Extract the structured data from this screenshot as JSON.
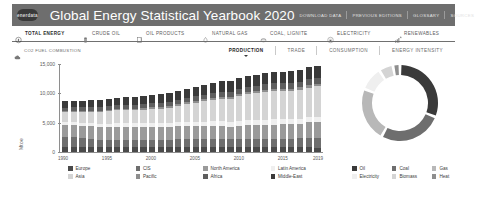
{
  "header": {
    "logo_text": "enerdata",
    "logo_icon": "enerdata-logo-icon",
    "title": "Global Energy Statistical Yearbook 2020",
    "links": [
      {
        "label": "DOWNLOAD DATA"
      },
      {
        "label": "PREVIOUS EDITIONS"
      },
      {
        "label": "GLOSSARY"
      },
      {
        "label": "SOURCES"
      }
    ],
    "bar_color": "#6e6e6e"
  },
  "nav": {
    "items": [
      {
        "label": "TOTAL ENERGY",
        "icon": "flash-circle-icon",
        "active": true
      },
      {
        "label": "CRUDE OIL",
        "icon": "oil-barrel-icon",
        "active": false
      },
      {
        "label": "OIL PRODUCTS",
        "icon": "jerrycan-icon",
        "active": false
      },
      {
        "label": "NATURAL GAS",
        "icon": "flame-icon",
        "active": false
      },
      {
        "label": "COAL, LIGNITE",
        "icon": "coal-icon",
        "active": false
      },
      {
        "label": "ELECTRICITY",
        "icon": "plug-circle-icon",
        "active": false
      },
      {
        "label": "RENEWABLES",
        "icon": "renewables-icon",
        "active": false
      }
    ]
  },
  "subbar": {
    "co2": {
      "label": "CO2 FUEL COMBUSTION",
      "icon": "co2-cloud-icon"
    },
    "tabs": [
      {
        "label": "PRODUCTION",
        "active": true
      },
      {
        "label": "TRADE",
        "active": false
      },
      {
        "label": "CONSUMPTION",
        "active": false
      },
      {
        "label": "ENERGY INTENSITY",
        "active": false
      }
    ]
  },
  "chart_data": [
    {
      "type": "bar",
      "stacked": true,
      "title": "",
      "xlabel": "",
      "ylabel": "Mtoe",
      "ylim": [
        0,
        15000
      ],
      "yticks": [
        0,
        5000,
        10000,
        15000
      ],
      "ytick_labels": [
        "0",
        "5,000",
        "10,000",
        "15,000"
      ],
      "grid": false,
      "legend_position": "bottom",
      "x": [
        1990,
        1991,
        1992,
        1993,
        1994,
        1995,
        1996,
        1997,
        1998,
        1999,
        2000,
        2001,
        2002,
        2003,
        2004,
        2005,
        2006,
        2007,
        2008,
        2009,
        2010,
        2011,
        2012,
        2013,
        2014,
        2015,
        2016,
        2017,
        2018,
        2019
      ],
      "xtick_labels": [
        "1990",
        "1995",
        "2000",
        "2005",
        "2010",
        "2015",
        "2019"
      ],
      "series": [
        {
          "name": "Europe",
          "color": "#4a4a4a",
          "values": [
            900,
            895,
            880,
            865,
            860,
            865,
            880,
            875,
            870,
            865,
            870,
            865,
            860,
            865,
            860,
            855,
            855,
            845,
            840,
            805,
            830,
            805,
            795,
            790,
            770,
            775,
            780,
            785,
            775,
            760
          ]
        },
        {
          "name": "CIS",
          "color": "#6e6e6e",
          "values": [
            1640,
            1595,
            1480,
            1385,
            1255,
            1230,
            1225,
            1175,
            1165,
            1185,
            1215,
            1230,
            1250,
            1300,
            1340,
            1365,
            1405,
            1420,
            1450,
            1390,
            1440,
            1485,
            1500,
            1485,
            1490,
            1490,
            1520,
            1555,
            1600,
            1620
          ]
        },
        {
          "name": "North America",
          "color": "#9a9a9a",
          "values": [
            2080,
            2110,
            2135,
            2125,
            2175,
            2190,
            2230,
            2245,
            2260,
            2240,
            2260,
            2215,
            2215,
            2190,
            2205,
            2155,
            2170,
            2185,
            2210,
            2130,
            2195,
            2245,
            2280,
            2350,
            2430,
            2450,
            2440,
            2510,
            2680,
            2770
          ]
        },
        {
          "name": "Latin America",
          "color": "#efefef",
          "values": [
            490,
            505,
            515,
            530,
            555,
            570,
            595,
            620,
            640,
            650,
            670,
            675,
            690,
            705,
            735,
            755,
            775,
            795,
            815,
            800,
            835,
            855,
            870,
            880,
            890,
            885,
            865,
            855,
            845,
            840
          ]
        },
        {
          "name": "Asia",
          "color": "#d4d4d4",
          "values": [
            1700,
            1760,
            1830,
            1900,
            1975,
            2080,
            2160,
            2215,
            2210,
            2275,
            2360,
            2430,
            2545,
            2790,
            3040,
            3255,
            3470,
            3660,
            3790,
            3925,
            4185,
            4475,
            4610,
            4740,
            4815,
            4795,
            4830,
            4935,
            5075,
            5215
          ]
        },
        {
          "name": "Pacific",
          "color": "#8e8e8e",
          "values": [
            195,
            200,
            205,
            215,
            220,
            230,
            240,
            245,
            250,
            255,
            265,
            270,
            280,
            285,
            295,
            300,
            310,
            315,
            325,
            325,
            340,
            345,
            355,
            365,
            375,
            385,
            395,
            405,
            420,
            435
          ]
        },
        {
          "name": "Africa",
          "color": "#5e5e5e",
          "values": [
            560,
            570,
            575,
            580,
            595,
            605,
            630,
            645,
            660,
            665,
            690,
            700,
            710,
            740,
            775,
            790,
            800,
            815,
            835,
            845,
            875,
            855,
            900,
            920,
            935,
            940,
            955,
            975,
            990,
            1010
          ]
        },
        {
          "name": "Middle-East",
          "color": "#3a3a3a",
          "values": [
            1080,
            1105,
            1165,
            1200,
            1240,
            1275,
            1300,
            1345,
            1390,
            1390,
            1450,
            1465,
            1455,
            1490,
            1570,
            1640,
            1700,
            1735,
            1805,
            1810,
            1870,
            1880,
            1905,
            1925,
            1960,
            2000,
            2050,
            2035,
            2040,
            2055
          ]
        }
      ]
    },
    {
      "type": "pie",
      "variant": "donut",
      "title": "",
      "legend_position": "bottom",
      "labels": [
        "Oil",
        "Coal",
        "Gas",
        "Electricity",
        "Biomass",
        "Heat"
      ],
      "values": [
        31,
        27,
        23,
        10,
        6,
        3
      ],
      "colors": [
        "#3a3a3a",
        "#6e6e6e",
        "#b8b8b8",
        "#efefef",
        "#d4d4d4",
        "#8e8e8e"
      ]
    }
  ]
}
